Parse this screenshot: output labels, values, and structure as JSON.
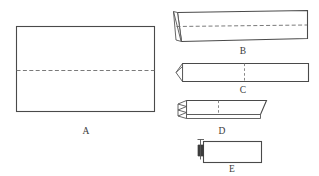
{
  "figure": {
    "background_color": "#ffffff",
    "line_color": "#4a4a4a",
    "dashed_line_color": "#6b6b6b",
    "accent_dark_color": "#3d3d3d",
    "panel_count": 5
  },
  "labels": {
    "a": "A",
    "b": "B",
    "c": "C",
    "d": "D",
    "e": "E"
  },
  "panels": [
    {
      "id": "A",
      "label": "A",
      "description": "Unfolded rectangular sheet with a horizontal dashed fold line across the middle",
      "fold_line": "horizontal-center-dashed",
      "label_x": 86,
      "label_y": 134
    },
    {
      "id": "B",
      "label": "B",
      "description": "Sheet folded in half along the horizontal crease, shown at an angle with a horizontal dashed crease and a triangular fold flap at the left end",
      "fold_line": "horizontal-dashed",
      "label_x": 243,
      "label_y": 54
    },
    {
      "id": "C",
      "label": "C",
      "description": "Narrower folded strip with a pointed folded tip at the left end and a vertical dashed fold line near the middle",
      "fold_line": "vertical-dashed",
      "label_x": 243,
      "label_y": 93
    },
    {
      "id": "D",
      "label": "D",
      "description": "Shorter folded strip with an accordion zigzag fold at the left end and a vertical dashed fold line",
      "fold_line": "vertical-dashed",
      "label_x": 222,
      "label_y": 134
    },
    {
      "id": "E",
      "label": "E",
      "description": "Final small folded rectangle with a dark folded tab at its left edge",
      "fold_line": "none",
      "label_x": 232,
      "label_y": 172
    }
  ]
}
